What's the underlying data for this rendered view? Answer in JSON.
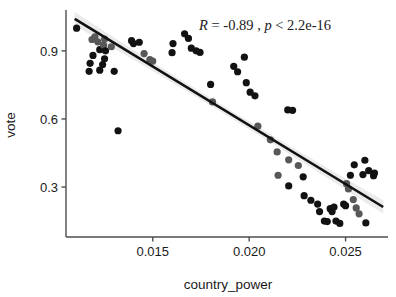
{
  "chart_data": {
    "type": "scatter",
    "title": "",
    "xlabel": "country_power",
    "ylabel": "vote",
    "xlim": [
      0.0105,
      0.0272
    ],
    "ylim": [
      0.08,
      1.08
    ],
    "xticks": [
      0.015,
      0.02,
      0.025
    ],
    "xtick_labels": [
      "0.015",
      "0.020",
      "0.025"
    ],
    "yticks": [
      0.3,
      0.6,
      0.9
    ],
    "ytick_labels": [
      "0.3",
      "0.6",
      "0.9"
    ],
    "grid": false,
    "legend": "none",
    "annotation": {
      "full_text": "R = -0.89 , p < 2.2e-16",
      "r_symbol": "R",
      "r_equals": " = ",
      "r_value": "-0.89",
      "separator": " , ",
      "p_symbol": "p",
      "p_operator": " < ",
      "p_value": "2.2e-16",
      "x": 0.0174,
      "y": 0.99
    },
    "regression": {
      "type": "linear",
      "slope": -51.8,
      "intercept": 1.608,
      "x_start": 0.01095,
      "x_end": 0.02695,
      "color": "#111111",
      "line_width": 2.6,
      "ci_band": true,
      "ci_color": "#e8e8e8"
    },
    "point_colors": {
      "dark": "#121212",
      "gray": "#585858"
    },
    "point_radius": 3.6,
    "series": [
      {
        "name": "observations",
        "points": [
          {
            "x": 0.01105,
            "y": 1.0,
            "c": "dark"
          },
          {
            "x": 0.01185,
            "y": 0.95,
            "c": "gray"
          },
          {
            "x": 0.012,
            "y": 0.962,
            "c": "gray"
          },
          {
            "x": 0.01215,
            "y": 0.94,
            "c": "gray"
          },
          {
            "x": 0.01225,
            "y": 0.905,
            "c": "dark"
          },
          {
            "x": 0.0119,
            "y": 0.88,
            "c": "dark"
          },
          {
            "x": 0.01175,
            "y": 0.845,
            "c": "dark"
          },
          {
            "x": 0.01245,
            "y": 0.925,
            "c": "gray"
          },
          {
            "x": 0.01255,
            "y": 0.9,
            "c": "dark"
          },
          {
            "x": 0.0125,
            "y": 0.865,
            "c": "dark"
          },
          {
            "x": 0.0124,
            "y": 0.84,
            "c": "dark"
          },
          {
            "x": 0.01225,
            "y": 0.815,
            "c": "dark"
          },
          {
            "x": 0.0117,
            "y": 0.81,
            "c": "dark"
          },
          {
            "x": 0.01285,
            "y": 0.918,
            "c": "gray"
          },
          {
            "x": 0.013,
            "y": 0.81,
            "c": "dark"
          },
          {
            "x": 0.0132,
            "y": 0.548,
            "c": "dark"
          },
          {
            "x": 0.0139,
            "y": 0.945,
            "c": "dark"
          },
          {
            "x": 0.014,
            "y": 0.932,
            "c": "dark"
          },
          {
            "x": 0.0143,
            "y": 0.938,
            "c": "dark"
          },
          {
            "x": 0.01455,
            "y": 0.888,
            "c": "gray"
          },
          {
            "x": 0.01485,
            "y": 0.862,
            "c": "gray"
          },
          {
            "x": 0.015,
            "y": 0.855,
            "c": "gray"
          },
          {
            "x": 0.01605,
            "y": 0.932,
            "c": "dark"
          },
          {
            "x": 0.016,
            "y": 0.892,
            "c": "dark"
          },
          {
            "x": 0.01665,
            "y": 0.975,
            "c": "dark"
          },
          {
            "x": 0.01685,
            "y": 0.955,
            "c": "dark"
          },
          {
            "x": 0.017,
            "y": 0.912,
            "c": "dark"
          },
          {
            "x": 0.01725,
            "y": 0.9,
            "c": "dark"
          },
          {
            "x": 0.01745,
            "y": 0.893,
            "c": "dark"
          },
          {
            "x": 0.018,
            "y": 0.752,
            "c": "dark"
          },
          {
            "x": 0.0181,
            "y": 0.675,
            "c": "gray"
          },
          {
            "x": 0.0192,
            "y": 0.832,
            "c": "dark"
          },
          {
            "x": 0.0194,
            "y": 0.808,
            "c": "dark"
          },
          {
            "x": 0.01975,
            "y": 0.872,
            "c": "dark"
          },
          {
            "x": 0.01985,
            "y": 0.76,
            "c": "dark"
          },
          {
            "x": 0.02005,
            "y": 0.718,
            "c": "dark"
          },
          {
            "x": 0.0203,
            "y": 0.702,
            "c": "dark"
          },
          {
            "x": 0.02045,
            "y": 0.568,
            "c": "gray"
          },
          {
            "x": 0.0211,
            "y": 0.508,
            "c": "gray"
          },
          {
            "x": 0.02145,
            "y": 0.455,
            "c": "gray"
          },
          {
            "x": 0.022,
            "y": 0.64,
            "c": "dark"
          },
          {
            "x": 0.02225,
            "y": 0.638,
            "c": "dark"
          },
          {
            "x": 0.02205,
            "y": 0.42,
            "c": "gray"
          },
          {
            "x": 0.02255,
            "y": 0.395,
            "c": "gray"
          },
          {
            "x": 0.0228,
            "y": 0.345,
            "c": "dark"
          },
          {
            "x": 0.02285,
            "y": 0.262,
            "c": "dark"
          },
          {
            "x": 0.0232,
            "y": 0.242,
            "c": "dark"
          },
          {
            "x": 0.02355,
            "y": 0.225,
            "c": "dark"
          },
          {
            "x": 0.02365,
            "y": 0.192,
            "c": "dark"
          },
          {
            "x": 0.0239,
            "y": 0.15,
            "c": "dark"
          },
          {
            "x": 0.02405,
            "y": 0.148,
            "c": "dark"
          },
          {
            "x": 0.0242,
            "y": 0.205,
            "c": "dark"
          },
          {
            "x": 0.0243,
            "y": 0.192,
            "c": "dark"
          },
          {
            "x": 0.0244,
            "y": 0.212,
            "c": "dark"
          },
          {
            "x": 0.0245,
            "y": 0.15,
            "c": "dark"
          },
          {
            "x": 0.0247,
            "y": 0.14,
            "c": "dark"
          },
          {
            "x": 0.0249,
            "y": 0.225,
            "c": "dark"
          },
          {
            "x": 0.025,
            "y": 0.218,
            "c": "dark"
          },
          {
            "x": 0.02505,
            "y": 0.315,
            "c": "gray"
          },
          {
            "x": 0.02515,
            "y": 0.292,
            "c": "gray"
          },
          {
            "x": 0.02525,
            "y": 0.352,
            "c": "dark"
          },
          {
            "x": 0.02545,
            "y": 0.398,
            "c": "dark"
          },
          {
            "x": 0.0254,
            "y": 0.245,
            "c": "gray"
          },
          {
            "x": 0.02555,
            "y": 0.208,
            "c": "gray"
          },
          {
            "x": 0.0257,
            "y": 0.182,
            "c": "gray"
          },
          {
            "x": 0.0259,
            "y": 0.355,
            "c": "dark"
          },
          {
            "x": 0.026,
            "y": 0.418,
            "c": "dark"
          },
          {
            "x": 0.0262,
            "y": 0.372,
            "c": "dark"
          },
          {
            "x": 0.02645,
            "y": 0.35,
            "c": "dark"
          },
          {
            "x": 0.0265,
            "y": 0.362,
            "c": "dark"
          },
          {
            "x": 0.02605,
            "y": 0.142,
            "c": "dark"
          },
          {
            "x": 0.02205,
            "y": 0.305,
            "c": "dark"
          },
          {
            "x": 0.0215,
            "y": 0.352,
            "c": "gray"
          },
          {
            "x": 0.0125,
            "y": 0.952,
            "c": "gray"
          }
        ]
      }
    ]
  }
}
